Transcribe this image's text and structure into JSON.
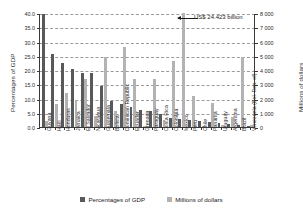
{
  "chart_data": {
    "type": "bar",
    "title": "",
    "subtitle": "",
    "categories": [
      "Guyana",
      "Haiti",
      "Honduras",
      "Jamaica",
      "El Salvador",
      "Nicaragua",
      "Guatemala",
      "Bolivia",
      "Dominican Republic",
      "Ecuador",
      "Grenada",
      "Paraguay",
      "Costa Rica",
      "Colombia",
      "Mexico",
      "Peru",
      "Chile",
      "Panama",
      "Uruguay",
      "Argentina",
      "Brazil",
      "Venezuela (Bol. Rep. of)"
    ],
    "series": [
      {
        "name": "Percentages of GDP",
        "axis": "left",
        "unit": "%",
        "color": "#595959",
        "values": [
          39.5,
          25.5,
          22.5,
          20.3,
          19.0,
          18.8,
          14.5,
          9.0,
          8.0,
          7.0,
          6.0,
          5.5,
          4.5,
          3.0,
          2.8,
          2.5,
          2.2,
          1.7,
          1.3,
          1.0,
          0.6,
          0.3
        ]
      },
      {
        "name": "Millions of dollars",
        "axis": "right",
        "unit": "millions of dollars",
        "color": "#b3b3b3",
        "values": [
          450,
          1600,
          2400,
          1900,
          3400,
          800,
          4900,
          1100,
          5600,
          3400,
          60,
          3350,
          520,
          4600,
          24423,
          2200,
          40,
          1700,
          110,
          700,
          4900,
          130
        ]
      }
    ],
    "annotation": {
      "text": "US$ 24.423 billion",
      "points_to": "Mexico"
    },
    "xlabel": "",
    "ylabel_left": "Percentages of GDP",
    "ylabel_right": "Millions of dollars",
    "ylim_left": [
      0,
      40
    ],
    "ylim_right": [
      0,
      8000
    ],
    "yticks_left": [
      "0.0",
      "5.0",
      "10.0",
      "15.0",
      "20.0",
      "25.0",
      "30.0",
      "35.0",
      "40.0"
    ],
    "yticks_right": [
      "0",
      "1 000",
      "2 000",
      "3 000",
      "4 000",
      "5 000",
      "6 000",
      "7 000",
      "8 000"
    ],
    "grid": true,
    "legend_position": "bottom",
    "legend": [
      "Percentages of GDP",
      "Millions of dollars"
    ]
  }
}
